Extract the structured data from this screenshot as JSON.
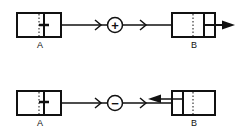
{
  "diagram": {
    "rows": [
      {
        "name": "positive-interaction",
        "source_label": "A",
        "target_label": "B",
        "operator": "+",
        "target_arrow_direction": "right"
      },
      {
        "name": "negative-interaction",
        "source_label": "A",
        "target_label": "B",
        "operator": "−",
        "target_arrow_direction": "left"
      }
    ],
    "colors": {
      "stroke": "#111111",
      "background": "#ffffff"
    }
  }
}
